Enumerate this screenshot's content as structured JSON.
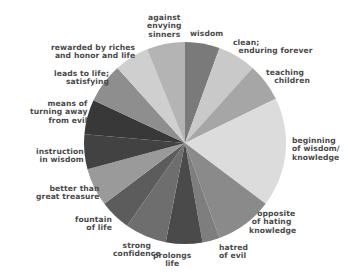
{
  "chart_data": {
    "type": "pie",
    "title": "",
    "start_angle_deg": 0,
    "direction": "clockwise",
    "center": [
      185,
      143
    ],
    "radius": 101,
    "slices": [
      {
        "label": "wisdom",
        "start": 0,
        "end": 20,
        "color": "#7a7a7a"
      },
      {
        "label": "clean;\nenduring forever",
        "start": 20,
        "end": 42,
        "color": "#c9c9c9"
      },
      {
        "label": "teaching\nchildren",
        "start": 42,
        "end": 64,
        "color": "#a6a6a6"
      },
      {
        "label": "beginning\nof wisdom/\nknowledge",
        "start": 64,
        "end": 127,
        "color": "#dcdcdc"
      },
      {
        "label": "opposite\nof hating\nknowledge",
        "start": 127,
        "end": 160,
        "color": "#8a8a8a"
      },
      {
        "label": "hatred\nof evil",
        "start": 160,
        "end": 170,
        "color": "#7e7e7e"
      },
      {
        "label": "prolongs\nlife",
        "start": 170,
        "end": 191,
        "color": "#4a4a4a"
      },
      {
        "label": "strong\nconfidence",
        "start": 191,
        "end": 215,
        "color": "#6e6e6e"
      },
      {
        "label": "fountain\nof life",
        "start": 215,
        "end": 233,
        "color": "#5c5c5c"
      },
      {
        "label": "better than\ngreat treasure",
        "start": 233,
        "end": 255,
        "color": "#9a9a9a"
      },
      {
        "label": "instruction\nin wisdom",
        "start": 255,
        "end": 275,
        "color": "#424242"
      },
      {
        "label": "means of\nturning away\nfrom evil",
        "start": 275,
        "end": 295,
        "color": "#383838"
      },
      {
        "label": "leads to life;\nsatisfying",
        "start": 295,
        "end": 318,
        "color": "#8e8e8e"
      },
      {
        "label": "rewarded by riches\nand honor and life",
        "start": 318,
        "end": 338,
        "color": "#cfcfcf"
      },
      {
        "label": "against\nenvying\nsinners",
        "start": 338,
        "end": 360,
        "color": "#b4b4b4"
      }
    ],
    "values_deg": [
      20,
      22,
      22,
      63,
      33,
      10,
      21,
      24,
      18,
      22,
      20,
      20,
      23,
      20,
      22
    ],
    "legend": "none (labels placed around pie)"
  },
  "labels": [
    {
      "text": "against\nenvying\nsinners",
      "x": 147,
      "y": 14,
      "align": "c"
    },
    {
      "text": "wisdom",
      "x": 190,
      "y": 30,
      "align": "l"
    },
    {
      "text": "clean;\n  enduring forever",
      "x": 233,
      "y": 39,
      "align": "l"
    },
    {
      "text": "teaching\n   children",
      "x": 266,
      "y": 69,
      "align": "l"
    },
    {
      "text": "beginning\nof wisdom/\nknowledge",
      "x": 292,
      "y": 137,
      "align": "l"
    },
    {
      "text": "   opposite\n of hating\nknowledge",
      "x": 249,
      "y": 210,
      "align": "l"
    },
    {
      "text": "hatred\nof evil",
      "x": 219,
      "y": 244,
      "align": "l"
    },
    {
      "text": "prolongs\nlife",
      "x": 153,
      "y": 252,
      "align": "c"
    },
    {
      "text": "strong\nconfidence",
      "x": 113,
      "y": 242,
      "align": "c"
    },
    {
      "text": "fountain\n   of life",
      "x": 75,
      "y": 216,
      "align": "r"
    },
    {
      "text": "better than\ngreat treasure",
      "x": 36,
      "y": 185,
      "align": "r"
    },
    {
      "text": "instruction\nin wisdom",
      "x": 36,
      "y": 148,
      "align": "r"
    },
    {
      "text": "means of\nturning away\nfrom evil",
      "x": 30,
      "y": 100,
      "align": "r"
    },
    {
      "text": "leads to life;\nsatisfying",
      "x": 54,
      "y": 70,
      "align": "r"
    },
    {
      "text": "rewarded by riches\nand honor and life",
      "x": 51,
      "y": 44,
      "align": "r"
    }
  ]
}
